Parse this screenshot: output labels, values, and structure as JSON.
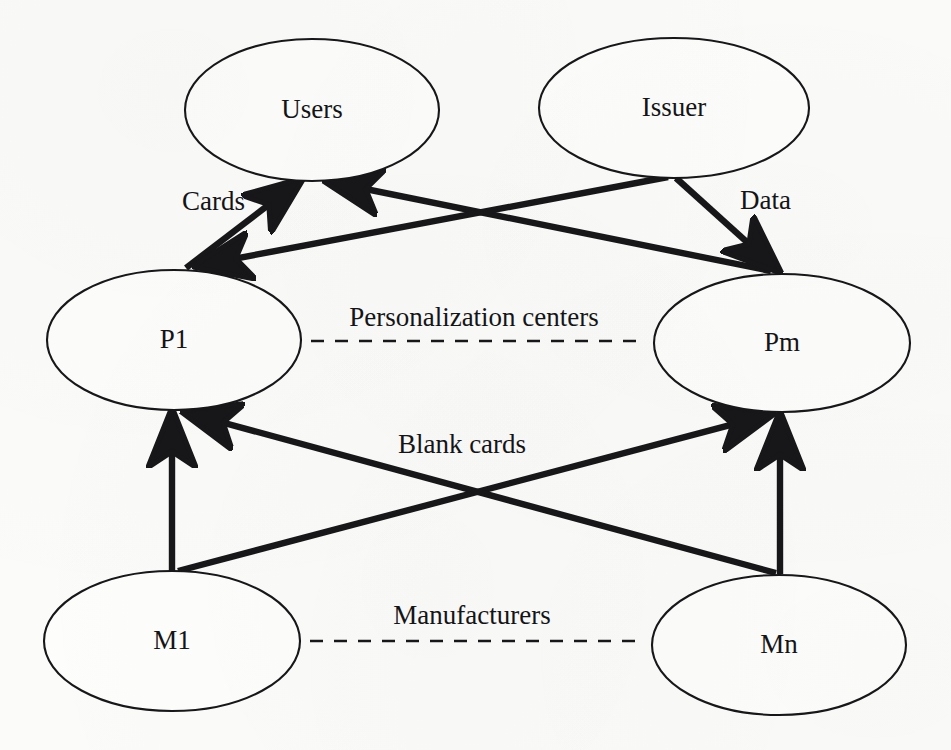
{
  "diagram": {
    "background_color": "#fbfbf9",
    "ink_color": "#17171a",
    "nodes": [
      {
        "id": "users",
        "label": "Users",
        "cx": 312,
        "cy": 110,
        "rx": 127,
        "ry": 71
      },
      {
        "id": "issuer",
        "label": "Issuer",
        "cx": 674,
        "cy": 108,
        "rx": 135,
        "ry": 70
      },
      {
        "id": "p1",
        "label": "P1",
        "cx": 174,
        "cy": 340,
        "rx": 127,
        "ry": 70
      },
      {
        "id": "pm",
        "label": "Pm",
        "cx": 782,
        "cy": 343,
        "rx": 128,
        "ry": 69
      },
      {
        "id": "m1",
        "label": "M1",
        "cx": 172,
        "cy": 641,
        "rx": 128,
        "ry": 70
      },
      {
        "id": "mn",
        "label": "Mn",
        "cx": 779,
        "cy": 645,
        "rx": 127,
        "ry": 70
      }
    ],
    "edges": [
      {
        "id": "p1-to-users",
        "from": "P1",
        "to": "Users",
        "label": "Cards",
        "x1": 186,
        "y1": 268,
        "x2": 301,
        "y2": 180
      },
      {
        "id": "pm-to-users",
        "from": "Pm",
        "to": "Users",
        "label": "",
        "x1": 771,
        "y1": 271,
        "x2": 326,
        "y2": 181
      },
      {
        "id": "issuer-to-p1",
        "from": "Issuer",
        "to": "P1",
        "label": "",
        "x1": 668,
        "y1": 177,
        "x2": 196,
        "y2": 266
      },
      {
        "id": "issuer-to-pm",
        "from": "Issuer",
        "to": "Pm",
        "label": "Data",
        "x1": 676,
        "y1": 178,
        "x2": 779,
        "y2": 271
      },
      {
        "id": "m1-to-p1",
        "from": "M1",
        "to": "P1",
        "label": "",
        "x1": 172,
        "y1": 572,
        "x2": 172,
        "y2": 411
      },
      {
        "id": "m1-to-pm",
        "from": "M1",
        "to": "Pm",
        "label": "Blank cards",
        "x1": 178,
        "y1": 571,
        "x2": 772,
        "y2": 414
      },
      {
        "id": "mn-to-p1",
        "from": "Mn",
        "to": "P1",
        "label": "",
        "x1": 776,
        "y1": 573,
        "x2": 184,
        "y2": 412
      },
      {
        "id": "mn-to-pm",
        "from": "Mn",
        "to": "Pm",
        "label": "",
        "x1": 780,
        "y1": 574,
        "x2": 780,
        "y2": 414
      }
    ],
    "flow_labels": [
      {
        "id": "cards-label",
        "text": "Cards",
        "x": 182,
        "y": 204,
        "anchor": "start"
      },
      {
        "id": "data-label",
        "text": "Data",
        "x": 740,
        "y": 203,
        "anchor": "start"
      },
      {
        "id": "blank-cards-label",
        "text": "Blank cards",
        "x": 462,
        "y": 447,
        "anchor": "center"
      }
    ],
    "groups": [
      {
        "id": "personalization-centers",
        "label": "Personalization centers",
        "label_x": 474,
        "label_y": 320,
        "line_x1": 311,
        "line_x2": 638,
        "line_y": 341
      },
      {
        "id": "manufacturers",
        "label": "Manufacturers",
        "label_x": 472,
        "label_y": 618,
        "line_x1": 310,
        "line_x2": 637,
        "line_y": 641
      }
    ]
  }
}
